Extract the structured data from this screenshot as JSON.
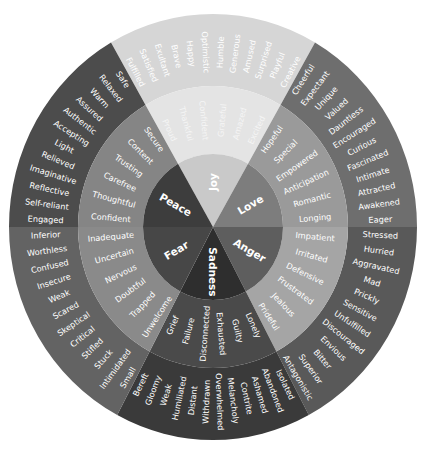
{
  "geometry": {
    "cx": 213,
    "cy": 227,
    "rx": 204,
    "ry": 213,
    "r_core": 70,
    "r_mid": 135
  },
  "colors": {
    "background": "#ffffff",
    "joy": {
      "core": "#c9c9c9",
      "mid": "#e4e4e4",
      "outer": "#d6d6d6"
    },
    "love": {
      "core": "#7d7d7d",
      "mid": "#9a9a9a",
      "outer": "#6e6e6e"
    },
    "anger": {
      "core": "#5e5e5e",
      "mid": "#a5a5a5",
      "outer": "#595959"
    },
    "sadness": {
      "core": "#2e2e2e",
      "mid": "#4a4a4a",
      "outer": "#3a3a3a"
    },
    "fear": {
      "core": "#474747",
      "mid": "#8a8a8a",
      "outer": "#636363"
    },
    "peace": {
      "core": "#3d3d3d",
      "mid": "#858585",
      "outer": "#4c4c4c"
    }
  },
  "emotions": [
    {
      "core": "Joy",
      "start": -30,
      "end": 30,
      "mid": [
        "Proud",
        "Thankful",
        "Confident",
        "Grateful",
        "Amazed",
        "Excited"
      ],
      "outer": [
        "Fulfilled",
        "Satisfied",
        "Exultant",
        "Brave",
        "Happy",
        "Optimistic",
        "Humble",
        "Generous",
        "Amused",
        "Surprised",
        "Playful",
        "Creative"
      ]
    },
    {
      "core": "Love",
      "start": 30,
      "end": 90,
      "mid": [
        "Hopeful",
        "Special",
        "Empowered",
        "Anticipation",
        "Romantic",
        "Longing"
      ],
      "outer": [
        "Cheerful",
        "Expectant",
        "Unique",
        "Valued",
        "Dauntless",
        "Encouraged",
        "Curious",
        "Fascinated",
        "Intimate",
        "Attracted",
        "Awakened",
        "Eager"
      ]
    },
    {
      "core": "Anger",
      "start": 90,
      "end": 152,
      "mid": [
        "Impatient",
        "Irritated",
        "Defensive",
        "Frustrated",
        "Jealous",
        "Prideful"
      ],
      "outer": [
        "Stressed",
        "Hurried",
        "Aggravated",
        "Mad",
        "Prickly",
        "Sensitive",
        "Unfulfilled",
        "Discouraged",
        "Envious",
        "Bitter",
        "Superior",
        "Antagonistic"
      ]
    },
    {
      "core": "Sadness",
      "start": 152,
      "end": 208,
      "mid": [
        "Lonely",
        "Guilty",
        "Exhausted",
        "Disconnected",
        "Failure",
        "Grief"
      ],
      "outer": [
        "Isolated",
        "Abandoned",
        "Ashamed",
        "Contrite",
        "Melancholy",
        "Overwhelmed",
        "Withdrawn",
        "Distant",
        "Humiliated",
        "Weak",
        "Gloomy",
        "Bereft"
      ]
    },
    {
      "core": "Fear",
      "start": 208,
      "end": 270,
      "mid": [
        "Unwelcome",
        "Trapped",
        "Doubtful",
        "Nervous",
        "Uncertain",
        "Inadequate"
      ],
      "outer": [
        "Small",
        "Intimidated",
        "Stuck",
        "Stifled",
        "Critical",
        "Skeptical",
        "Scared",
        "Weak",
        "Insecure",
        "Confused",
        "Worthless",
        "Inferior"
      ]
    },
    {
      "core": "Peace",
      "start": 270,
      "end": 330,
      "mid": [
        "Confident",
        "Thoughtful",
        "Carefree",
        "Trusting",
        "Content",
        "Secure"
      ],
      "outer": [
        "Engaged",
        "Self-reliant",
        "Reflective",
        "Imaginative",
        "Relieved",
        "Light",
        "Accepting",
        "Authentic",
        "Assured",
        "Warm",
        "Relaxed",
        "Safe"
      ]
    }
  ]
}
